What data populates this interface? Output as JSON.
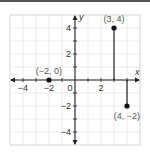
{
  "chart_data": {
    "type": "scatter",
    "title": "",
    "xlabel": "x",
    "ylabel": "y",
    "xlim": [
      -5,
      5
    ],
    "ylim": [
      -5,
      5
    ],
    "grid": true,
    "x_ticks": [
      -4,
      -2,
      0,
      2
    ],
    "x_tick_labels": [
      "−4",
      "−2",
      "0",
      "2"
    ],
    "y_ticks": [
      4,
      2,
      -2,
      -4
    ],
    "y_tick_labels": [
      "4",
      "2",
      "−2",
      "−4"
    ],
    "points": [
      {
        "x": -2,
        "y": 0,
        "label": "(−2, 0)"
      },
      {
        "x": 3,
        "y": 4,
        "label": "(3, 4)"
      },
      {
        "x": 4,
        "y": -2,
        "label": "(4, −2)"
      }
    ],
    "segments": [
      {
        "from": [
          3,
          0
        ],
        "to": [
          3,
          4
        ]
      },
      {
        "from": [
          4,
          0
        ],
        "to": [
          4,
          -2
        ]
      }
    ],
    "colors": {
      "axis": "#222222",
      "grid": "#dddddd",
      "point": "#111111",
      "label": "#555555"
    }
  }
}
